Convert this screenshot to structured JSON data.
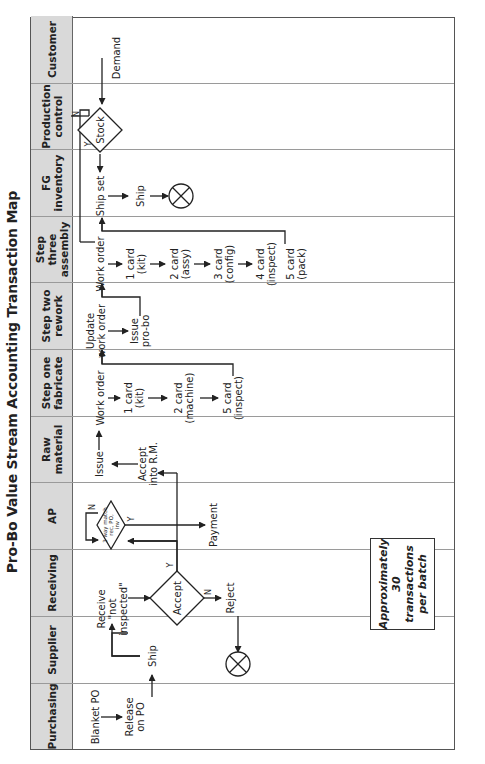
{
  "title": "Pro-Bo Value Stream Accounting Transaction Map",
  "lanes": [
    {
      "name": "Purchasing"
    },
    {
      "name": "Supplier"
    },
    {
      "name": "Receiving"
    },
    {
      "name": "AP"
    },
    {
      "name": "Raw material"
    },
    {
      "name": "Step one fabricate"
    },
    {
      "name": "Step two rework"
    },
    {
      "name": "Step three assembly"
    },
    {
      "name": "FG inventory"
    },
    {
      "name": "Production control"
    },
    {
      "name": "Customer"
    }
  ],
  "nodes": {
    "blanket_po": "Blanket PO",
    "release_on_po_1": "Release",
    "release_on_po_2": "on PO",
    "ship_supplier": "Ship",
    "receive_1": "Receive",
    "receive_2": "\"not",
    "receive_3": "inspected\"",
    "accept_decision": "Accept",
    "accept_yes": "Y",
    "accept_no": "N",
    "reject": "Reject",
    "three_way_1": "3 way match",
    "three_way_2": "rec, PO,",
    "three_way_3": "inv",
    "three_way_yes": "Y",
    "three_way_no": "N",
    "payment": "Payment",
    "issue": "Issue",
    "accept_rm_1": "Accept",
    "accept_rm_2": "into R.M.",
    "fab_work_order": "Work order",
    "fab_card1_1": "1 card",
    "fab_card1_2": "(kit)",
    "fab_card2_1": "2 card",
    "fab_card2_2": "(machine)",
    "fab_card5_1": "5 card",
    "fab_card5_2": "(inspect)",
    "rework_update_1": "Update",
    "rework_update_2": "work order",
    "rework_issue_1": "Issue",
    "rework_issue_2": "pro-bo",
    "asm_work_order": "Work order",
    "asm_card1_1": "1 card",
    "asm_card1_2": "(kit)",
    "asm_card2_1": "2 card",
    "asm_card2_2": "(assy)",
    "asm_card3_1": "3 card",
    "asm_card3_2": "(config)",
    "asm_card4_1": "4 card",
    "asm_card4_2": "(inspect)",
    "asm_card5_1": "5 card",
    "asm_card5_2": "(pack)",
    "ship_set": "Ship set",
    "ship_fg": "Ship",
    "stock_decision": "Stock",
    "stock_yes": "Y",
    "stock_no": "N",
    "demand": "Demand"
  },
  "note": {
    "line1": "Approximately",
    "line2": "30 transactions",
    "line3": "per batch"
  },
  "colors": {
    "header_bg": "#d9d9d9",
    "line": "#222222",
    "grid": "#9a9a9a"
  }
}
